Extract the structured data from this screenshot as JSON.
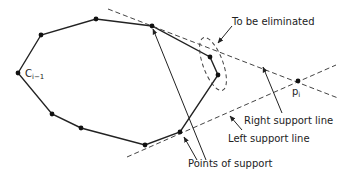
{
  "diagram": {
    "hull_label": "C",
    "hull_subscript": "i−1",
    "point_label": "p",
    "point_subscript": "i",
    "labels": {
      "eliminated": "To be eliminated",
      "right_support": "Right support line",
      "left_support": "Left support line",
      "support_points": "Points of support"
    },
    "vertices": [
      {
        "id": "c-im1",
        "x": 18,
        "y": 73
      },
      {
        "id": "v1",
        "x": 41,
        "y": 35
      },
      {
        "id": "v2",
        "x": 96,
        "y": 19
      },
      {
        "id": "support-upper",
        "x": 152,
        "y": 26
      },
      {
        "id": "elim-1",
        "x": 210,
        "y": 57
      },
      {
        "id": "elim-2",
        "x": 218,
        "y": 75
      },
      {
        "id": "support-lower",
        "x": 180,
        "y": 132
      },
      {
        "id": "v7",
        "x": 145,
        "y": 145
      },
      {
        "id": "v8",
        "x": 81,
        "y": 128
      },
      {
        "id": "v9",
        "x": 52,
        "y": 114
      }
    ],
    "new_point": {
      "x": 298,
      "y": 81
    },
    "colors": {
      "stroke": "#222222",
      "dash": "#444444"
    }
  }
}
